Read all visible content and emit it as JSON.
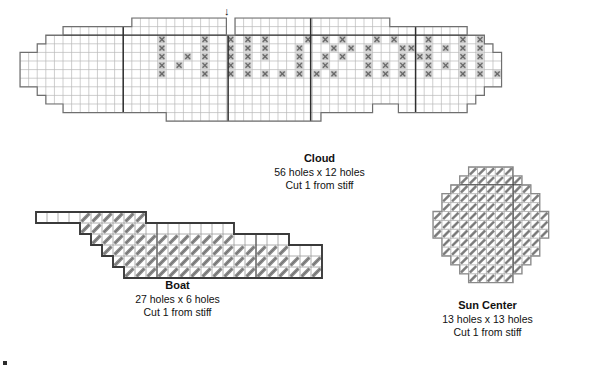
{
  "document": {
    "kind": "plastic-canvas-stitch-pattern-sheet",
    "background_color": "#ffffff",
    "ink_color": "#1a1a1a",
    "grid_line_color": "#b9b9b9",
    "outline_color": "#6f6f6f",
    "bold_outline_color": "#3a3a3a",
    "ruler_line_color": "#2e2e2e",
    "stitch_color": "#8a8a8a",
    "stitch_fill_color": "#c9c9c9"
  },
  "pieces": [
    {
      "id": "cloud",
      "name": "Cloud",
      "title": "Cloud",
      "dimensions": "56 holes x 12 holes",
      "instruction": "Cut 1 from stiff",
      "cols": 56,
      "rows": 12,
      "cell": 8.6,
      "origin": {
        "x": 19,
        "y": 17
      },
      "marker": {
        "name": "center-arrow-marker",
        "glyph": "↓",
        "col": 24.2
      },
      "ruler_cols": [
        12,
        24.2,
        33.8,
        46
      ],
      "ruler_rows": [
        2
      ],
      "top_profile": [
        4,
        4,
        3,
        2,
        2,
        1,
        1,
        1,
        1,
        1,
        1,
        1,
        1,
        0,
        0,
        0,
        0,
        0,
        0,
        0,
        0,
        0,
        0,
        0,
        2,
        0,
        0,
        0,
        0,
        0,
        0,
        0,
        0,
        0,
        0,
        0,
        0,
        0,
        0,
        0,
        0,
        0,
        0,
        1,
        1,
        1,
        1,
        1,
        1,
        1,
        1,
        1,
        2,
        2,
        3,
        4
      ],
      "bottom_profile": [
        4,
        4,
        3,
        2,
        2,
        1,
        1,
        1,
        1,
        1,
        1,
        1,
        1,
        1,
        1,
        1,
        1,
        0,
        0,
        0,
        0,
        0,
        0,
        0,
        0,
        0,
        0,
        0,
        0,
        0,
        0,
        0,
        0,
        0,
        0,
        1,
        1,
        1,
        1,
        1,
        1,
        2,
        2,
        2,
        1,
        1,
        1,
        1,
        1,
        1,
        1,
        1,
        2,
        3,
        4,
        4
      ],
      "stitch_symbol": "filled-cross-square",
      "stitch_cells": [
        [
          16,
          2
        ],
        [
          21,
          2
        ],
        [
          24,
          2
        ],
        [
          26,
          2
        ],
        [
          28,
          2
        ],
        [
          33,
          2
        ],
        [
          35,
          2
        ],
        [
          37,
          2
        ],
        [
          41,
          2
        ],
        [
          43,
          2
        ],
        [
          47,
          2
        ],
        [
          51,
          2
        ],
        [
          53,
          2
        ],
        [
          55,
          2
        ],
        [
          16,
          3
        ],
        [
          21,
          3
        ],
        [
          24,
          3
        ],
        [
          26,
          3
        ],
        [
          28,
          3
        ],
        [
          32,
          3
        ],
        [
          36,
          3
        ],
        [
          38,
          3
        ],
        [
          40,
          3
        ],
        [
          44,
          3
        ],
        [
          45,
          3
        ],
        [
          47,
          3
        ],
        [
          49,
          3
        ],
        [
          51,
          3
        ],
        [
          53,
          3
        ],
        [
          16,
          4
        ],
        [
          19,
          4
        ],
        [
          21,
          4
        ],
        [
          24,
          4
        ],
        [
          26,
          4
        ],
        [
          28,
          4
        ],
        [
          32,
          4
        ],
        [
          35,
          4
        ],
        [
          37,
          4
        ],
        [
          40,
          4
        ],
        [
          44,
          4
        ],
        [
          46,
          4
        ],
        [
          47,
          4
        ],
        [
          51,
          4
        ],
        [
          53,
          4
        ],
        [
          16,
          5
        ],
        [
          18,
          5
        ],
        [
          21,
          5
        ],
        [
          24,
          5
        ],
        [
          26,
          5
        ],
        [
          32,
          5
        ],
        [
          35,
          5
        ],
        [
          40,
          5
        ],
        [
          42,
          5
        ],
        [
          44,
          5
        ],
        [
          47,
          5
        ],
        [
          49,
          5
        ],
        [
          51,
          5
        ],
        [
          53,
          5
        ],
        [
          16,
          6
        ],
        [
          21,
          6
        ],
        [
          24,
          6
        ],
        [
          26,
          6
        ],
        [
          28,
          6
        ],
        [
          30,
          6
        ],
        [
          32,
          6
        ],
        [
          34,
          6
        ],
        [
          36,
          6
        ],
        [
          40,
          6
        ],
        [
          42,
          6
        ],
        [
          44,
          6
        ],
        [
          47,
          6
        ],
        [
          51,
          6
        ],
        [
          53,
          6
        ],
        [
          55,
          6
        ]
      ]
    },
    {
      "id": "boat",
      "name": "Boat",
      "title": "Boat",
      "dimensions": "27 holes x 6 holes",
      "instruction": "Cut 1 from stiff",
      "cols": 27,
      "rows": 6,
      "cell": 11.0,
      "origin": {
        "x": 35,
        "y": 211
      },
      "stitch_symbol": "diagonal-slanted-stitch",
      "shape_rows": [
        {
          "row": 0,
          "start": 0,
          "end": 10
        },
        {
          "row": 1,
          "start": 4,
          "end": 18
        },
        {
          "row": 2,
          "start": 5,
          "end": 23
        },
        {
          "row": 3,
          "start": 6,
          "end": 26
        },
        {
          "row": 4,
          "start": 7,
          "end": 26
        },
        {
          "row": 5,
          "start": 8,
          "end": 26
        }
      ],
      "unstitched_rows": [
        {
          "row": 0,
          "start": 0,
          "end": 4
        },
        {
          "row": 1,
          "start": 10,
          "end": 18
        },
        {
          "row": 2,
          "start": 18,
          "end": 23
        },
        {
          "row": 3,
          "start": 23,
          "end": 26
        }
      ],
      "ruler_cols": [
        11,
        20
      ]
    },
    {
      "id": "sun-center",
      "name": "Sun Center",
      "title": "Sun Center",
      "dimensions": "13 holes x 13 holes",
      "instruction": "Cut 1 from stiff",
      "cols": 13,
      "rows": 13,
      "cell": 8.9,
      "origin": {
        "x": 432,
        "y": 166
      },
      "stitch_symbol": "diagonal-slanted-stitch",
      "shape_rows": [
        {
          "row": 0,
          "start": 4,
          "end": 9
        },
        {
          "row": 1,
          "start": 3,
          "end": 10
        },
        {
          "row": 2,
          "start": 2,
          "end": 11
        },
        {
          "row": 3,
          "start": 1,
          "end": 12
        },
        {
          "row": 4,
          "start": 1,
          "end": 12
        },
        {
          "row": 5,
          "start": 0,
          "end": 13
        },
        {
          "row": 6,
          "start": 0,
          "end": 13
        },
        {
          "row": 7,
          "start": 0,
          "end": 13
        },
        {
          "row": 8,
          "start": 1,
          "end": 12
        },
        {
          "row": 9,
          "start": 1,
          "end": 12
        },
        {
          "row": 10,
          "start": 2,
          "end": 11
        },
        {
          "row": 11,
          "start": 3,
          "end": 10
        },
        {
          "row": 12,
          "start": 4,
          "end": 9
        }
      ],
      "ruler_cols": [
        9
      ],
      "ruler_rows": [
        2
      ]
    }
  ],
  "captions": {
    "cloud": {
      "x": 237,
      "y": 152,
      "w": 165
    },
    "boat": {
      "x": 95,
      "y": 279,
      "w": 165
    },
    "sun_center": {
      "x": 405,
      "y": 299,
      "w": 165
    }
  }
}
